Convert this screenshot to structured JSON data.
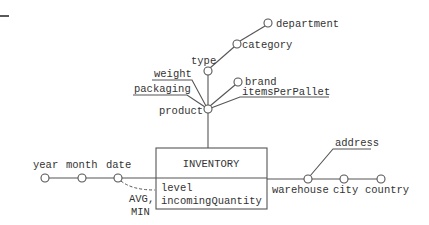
{
  "diagram": {
    "type": "dimensional fact model",
    "fact": {
      "name": "INVENTORY",
      "measures": [
        "level",
        "incomingQuantity"
      ]
    },
    "dimensions": {
      "product": {
        "label": "product",
        "hierarchy": [
          "type",
          "category",
          "department"
        ],
        "children": [
          "brand"
        ],
        "descriptive_attributes": [
          "weight",
          "packaging",
          "itemsPerPallet"
        ]
      },
      "date": {
        "label": "date",
        "hierarchy": [
          "month",
          "year"
        ]
      },
      "warehouse": {
        "label": "warehouse",
        "hierarchy": [
          "city",
          "country"
        ],
        "descriptive_attributes": [
          "address"
        ]
      }
    },
    "aggregation_note": {
      "line1": "AVG,",
      "line2": "MIN"
    },
    "labels": {
      "department": "department",
      "category": "category",
      "type": "type",
      "weight": "weight",
      "brand": "brand",
      "packaging": "packaging",
      "itemsPerPallet": "itemsPerPallet",
      "product": "product",
      "address": "address",
      "year": "year",
      "month": "month",
      "date": "date",
      "warehouse": "warehouse",
      "city": "city",
      "country": "country",
      "fact_name": "INVENTORY",
      "measure_1": "level",
      "measure_2": "incomingQuantity"
    },
    "colors": {
      "line": "#555555",
      "text": "#333333",
      "background": "#ffffff"
    }
  }
}
